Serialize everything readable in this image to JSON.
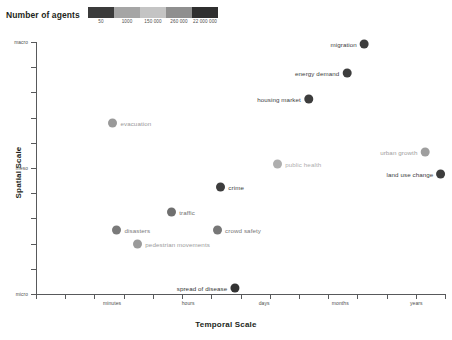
{
  "legend": {
    "title": "Number of agents",
    "ticks": [
      "50",
      "1000",
      "150 000",
      "260 000",
      "22 000 000"
    ],
    "segment_colors": [
      "#3b3b3b",
      "#a5a5a5",
      "#c4c4c4",
      "#8f8f8f",
      "#2f2f2f"
    ]
  },
  "chart_data": {
    "type": "scatter",
    "title": "",
    "xlabel": "Temporal Scale",
    "ylabel": "Spatial Scale",
    "grid": false,
    "legend_position": "top",
    "xtick_labels": [
      "minutes",
      "hours",
      "days",
      "months",
      "years"
    ],
    "ytick_labels": [
      "macro",
      "meso",
      "micro"
    ],
    "points": [
      {
        "label": "migration",
        "x": 0.803,
        "y": 0.992,
        "color": "#3d3d3d",
        "label_side": "left"
      },
      {
        "label": "energy demand",
        "x": 0.76,
        "y": 0.877,
        "color": "#3d3d3d",
        "label_side": "left"
      },
      {
        "label": "housing market",
        "x": 0.666,
        "y": 0.774,
        "color": "#3d3d3d",
        "label_side": "left"
      },
      {
        "label": "evacuation",
        "x": 0.188,
        "y": 0.679,
        "color": "#999999",
        "label_side": "right"
      },
      {
        "label": "urban growth",
        "x": 0.951,
        "y": 0.563,
        "color": "#9e9e9e",
        "label_side": "left"
      },
      {
        "label": "public health",
        "x": 0.591,
        "y": 0.516,
        "color": "#aeaeae",
        "label_side": "right"
      },
      {
        "label": "land use change",
        "x": 0.99,
        "y": 0.476,
        "color": "#3d3d3d",
        "label_side": "left"
      },
      {
        "label": "crime",
        "x": 0.452,
        "y": 0.425,
        "color": "#3d3d3d",
        "label_side": "right"
      },
      {
        "label": "traffic",
        "x": 0.332,
        "y": 0.325,
        "color": "#6f6f6f",
        "label_side": "right"
      },
      {
        "label": "disasters",
        "x": 0.198,
        "y": 0.254,
        "color": "#7a7a7a",
        "label_side": "right"
      },
      {
        "label": "crowd safety",
        "x": 0.444,
        "y": 0.254,
        "color": "#777777",
        "label_side": "right"
      },
      {
        "label": "pedestrian movements",
        "x": 0.249,
        "y": 0.198,
        "color": "#9a9a9a",
        "label_side": "right"
      },
      {
        "label": "spread of disease",
        "x": 0.486,
        "y": 0.024,
        "color": "#333333",
        "label_side": "left"
      }
    ]
  }
}
